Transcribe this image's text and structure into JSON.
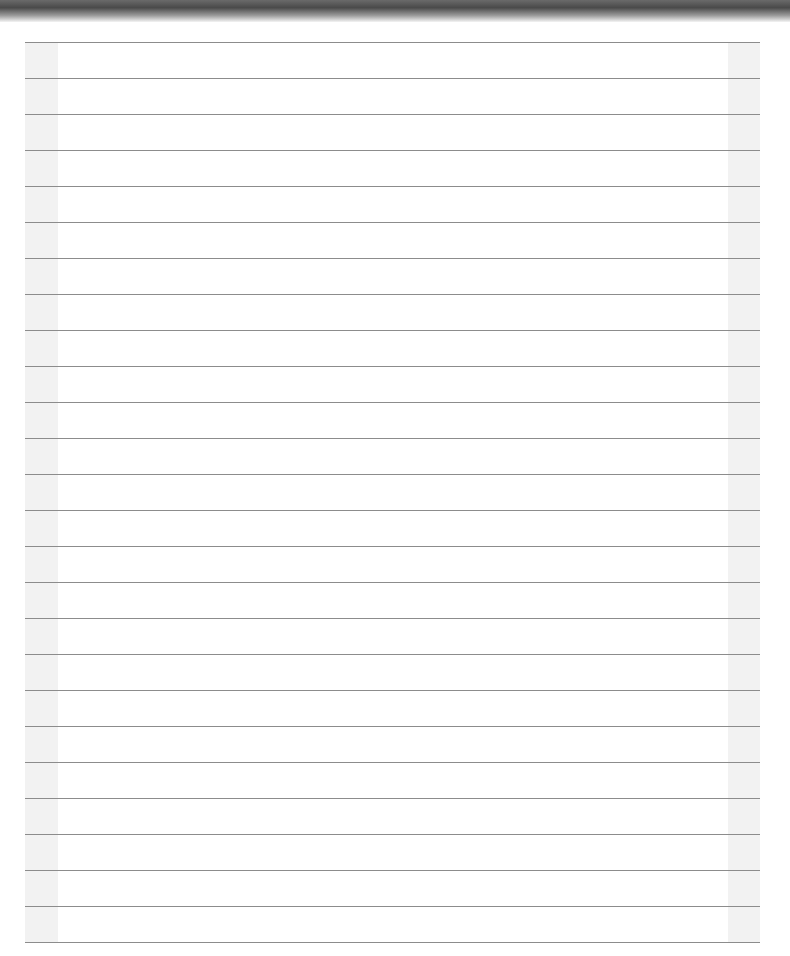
{
  "page": {
    "type": "lined-paper",
    "ruled_line_count": 26,
    "colors": {
      "paper": "#ffffff",
      "margin_band": "#f2f2f2",
      "rule_line": "#8c8c8c",
      "top_shadow": "#4a4a4a"
    }
  }
}
